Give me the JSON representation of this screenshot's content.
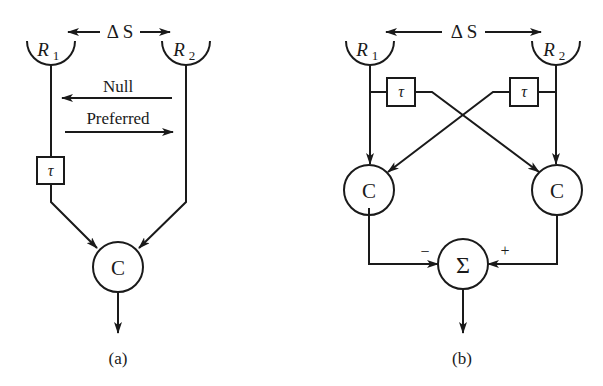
{
  "figure": {
    "panel_a": {
      "caption": "(a)",
      "receptor_left": {
        "name": "R",
        "sub": "1"
      },
      "receptor_right": {
        "name": "R",
        "sub": "2"
      },
      "separation_label": "Δ S",
      "delay_label": "τ",
      "correlator_label": "C",
      "direction_null": "Null",
      "direction_preferred": "Preferred"
    },
    "panel_b": {
      "caption": "(b)",
      "receptor_left": {
        "name": "R",
        "sub": "1"
      },
      "receptor_right": {
        "name": "R",
        "sub": "2"
      },
      "separation_label": "Δ S",
      "delay_left_label": "τ",
      "delay_right_label": "τ",
      "correlator_left_label": "C",
      "correlator_right_label": "C",
      "summation_label": "Σ",
      "sign_minus": "−",
      "sign_plus": "+"
    },
    "colors": {
      "ink": "#1a1a1a",
      "background": "#ffffff"
    }
  }
}
